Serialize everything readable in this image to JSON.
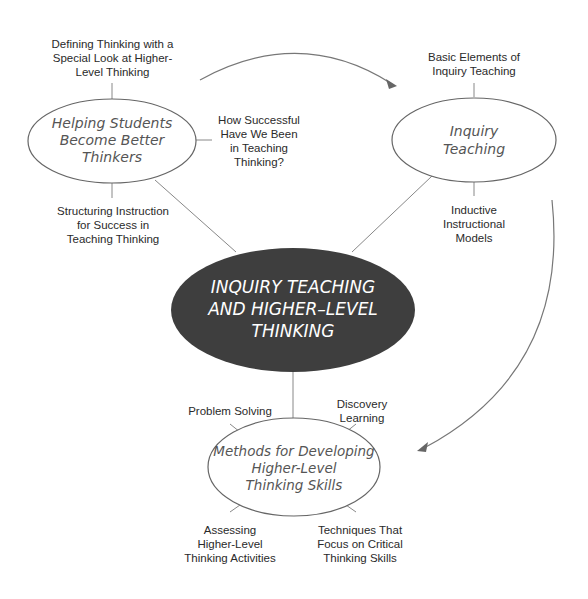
{
  "diagram": {
    "center": {
      "label": "INQUIRY TEACHING\nAND HIGHER–LEVEL\nTHINKING",
      "fill": "#3e3e3e",
      "text_color": "#ffffff"
    },
    "nodes": [
      {
        "id": "helping",
        "label": "Helping Students\nBecome Better\nThinkers",
        "subtopics": [
          "Defining Thinking with a\nSpecial Look at Higher-\nLevel Thinking",
          "How Successful\nHave We Been\nin Teaching\nThinking?",
          "Structuring Instruction\nfor Success in\nTeaching Thinking"
        ]
      },
      {
        "id": "inquiry",
        "label": "Inquiry\nTeaching",
        "subtopics": [
          "Basic Elements of\nInquiry Teaching",
          "Inductive\nInstructional\nModels"
        ]
      },
      {
        "id": "methods",
        "label": "Methods for Developing\nHigher-Level\nThinking Skills",
        "subtopics": [
          "Problem Solving",
          "Discovery\nLearning",
          "Assessing\nHigher-Level\nThinking Activities",
          "Techniques That\nFocus on Critical\nThinking Skills"
        ]
      }
    ],
    "arrows": [
      {
        "from": "helping",
        "to": "inquiry"
      },
      {
        "from": "inquiry",
        "to": "methods"
      }
    ],
    "line_color": "#777777"
  }
}
